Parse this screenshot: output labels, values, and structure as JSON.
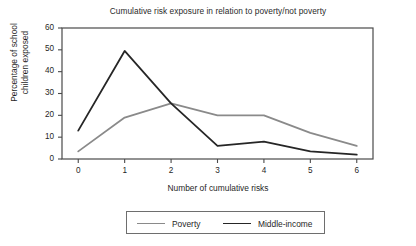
{
  "chart_data": {
    "type": "line",
    "title": "Cumulative risk exposure in relation to poverty/not poverty",
    "xlabel": "Number of cumulative risks",
    "ylabel_line1": "Percentage of school",
    "ylabel_line2": "children exposed",
    "x": [
      0,
      1,
      2,
      3,
      4,
      5,
      6
    ],
    "xticklabels": [
      "0",
      "1",
      "2",
      "3",
      "4",
      "5",
      "6"
    ],
    "yticks": [
      0,
      10,
      20,
      30,
      40,
      50,
      60
    ],
    "yticklabels": [
      "0",
      "10",
      "20",
      "30",
      "40",
      "50",
      "60"
    ],
    "xlim": [
      -0.35,
      6.35
    ],
    "ylim": [
      0,
      60
    ],
    "grid": false,
    "legend_position": "below",
    "series": [
      {
        "name": "Poverty",
        "color": "#8a8a8a",
        "linewidth": 1.8,
        "values": [
          3.5,
          19,
          25.5,
          20,
          20,
          12,
          6
        ]
      },
      {
        "name": "Middle-income",
        "color": "#262626",
        "linewidth": 1.8,
        "values": [
          13,
          49.5,
          25.5,
          6,
          8,
          3.5,
          2
        ]
      }
    ]
  },
  "axes": {
    "frame_color": "#4a4a4a"
  }
}
